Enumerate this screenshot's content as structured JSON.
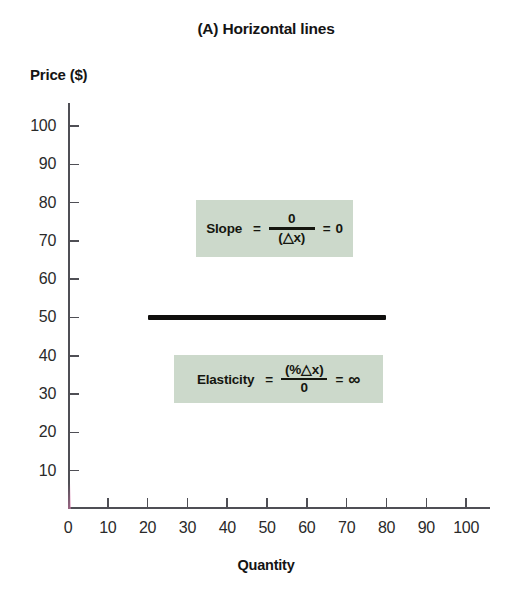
{
  "chart_data": {
    "type": "line",
    "title": "(A) Horizontal lines",
    "xlabel": "Quantity",
    "ylabel": "Price ($)",
    "xlim": [
      0,
      106
    ],
    "ylim": [
      0,
      106
    ],
    "xticks": [
      0,
      10,
      20,
      30,
      40,
      50,
      60,
      70,
      80,
      90,
      100
    ],
    "yticks": [
      10,
      20,
      30,
      40,
      50,
      60,
      70,
      80,
      90,
      100
    ],
    "grid": false,
    "legend": null,
    "series": [
      {
        "name": "horizontal-demand-line",
        "color": "#100f0d",
        "x": [
          20,
          80
        ],
        "y": [
          50,
          50
        ]
      }
    ],
    "annotations": [
      {
        "name": "slope",
        "label": "Slope",
        "equals": "=",
        "numerator": "0",
        "denominator": "(△x)",
        "equals2": "=",
        "result": "0",
        "background": "#ccd9cb"
      },
      {
        "name": "elasticity",
        "label": "Elasticity",
        "equals": "=",
        "numerator": "(%△x)",
        "denominator": "0",
        "equals2": "=",
        "result": "∞",
        "background": "#ccd9cb"
      }
    ]
  },
  "colors": {
    "axis": "#4f4f55",
    "line": "#100f0d",
    "annotation_bg": "#ccd9cb",
    "text": "#1a1a1a",
    "background": "#ffffff"
  }
}
